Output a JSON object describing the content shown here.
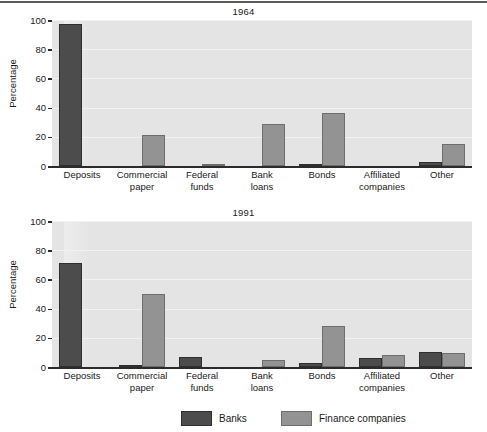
{
  "figure": {
    "ylabel": "Percentage",
    "legend": {
      "items": [
        {
          "label": "Banks",
          "color": "#4c4c4c",
          "key": "banks"
        },
        {
          "label": "Finance companies",
          "color": "#939393",
          "key": "finance"
        }
      ]
    }
  },
  "chart_data": [
    {
      "type": "bar",
      "title": "1964",
      "xlabel": "",
      "ylabel": "Percentage",
      "ylim": [
        0,
        100
      ],
      "yticks": [
        0,
        20,
        40,
        60,
        80,
        100
      ],
      "grid": true,
      "legend_position": "bottom",
      "categories": [
        "Deposits",
        "Commercial paper",
        "Federal funds",
        "Bank loans",
        "Bonds",
        "Affiliated companies",
        "Other"
      ],
      "series": [
        {
          "name": "Banks",
          "color": "#4c4c4c",
          "values": [
            97,
            0,
            0,
            0,
            1,
            0,
            3
          ]
        },
        {
          "name": "Finance companies",
          "color": "#939393",
          "values": [
            0,
            21.5,
            1,
            29,
            36,
            0,
            15
          ]
        }
      ]
    },
    {
      "type": "bar",
      "title": "1991",
      "xlabel": "",
      "ylabel": "Percentage",
      "ylim": [
        0,
        100
      ],
      "yticks": [
        0,
        20,
        40,
        60,
        80,
        100
      ],
      "grid": true,
      "legend_position": "bottom",
      "categories": [
        "Deposits",
        "Commercial paper",
        "Federal funds",
        "Bank loans",
        "Bonds",
        "Affiliated companies",
        "Other"
      ],
      "series": [
        {
          "name": "Banks",
          "color": "#4c4c4c",
          "values": [
            71,
            1.5,
            7,
            0,
            3,
            6.5,
            10.5
          ]
        },
        {
          "name": "Finance companies",
          "color": "#939393",
          "values": [
            0,
            50,
            0,
            5,
            28,
            8.5,
            9.5
          ]
        }
      ]
    }
  ],
  "category_labels": [
    [
      "Deposits"
    ],
    [
      "Commercial",
      "paper"
    ],
    [
      "Federal",
      "funds"
    ],
    [
      "Bank",
      "loans"
    ],
    [
      "Bonds"
    ],
    [
      "Affiliated",
      "companies"
    ],
    [
      "Other"
    ]
  ]
}
